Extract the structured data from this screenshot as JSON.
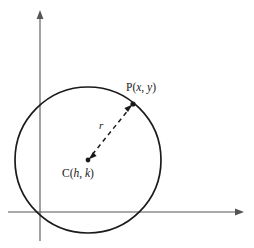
{
  "figure": {
    "name": "circle-with-center-and-point",
    "background_color": "#ffffff",
    "stroke_color": "#1a1a1a",
    "axis_color": "#555555",
    "labels": {
      "point_p": {
        "prefix": "P(",
        "var_x": "x",
        "separator": ", ",
        "var_y": "y",
        "suffix": ")",
        "full_text": "P(x, y)"
      },
      "center_c": {
        "prefix": "C(",
        "var_h": "h",
        "separator": ", ",
        "var_k": "k",
        "suffix": ")",
        "full_text": "C(h, k)"
      },
      "radius_r": {
        "full_text": "r"
      }
    },
    "axes": {
      "x_axis_label": "",
      "y_axis_label": "",
      "origin_x": 40,
      "origin_y": 212,
      "x_axis_start": 8,
      "x_axis_end": 244,
      "y_axis_top": 10,
      "y_axis_bottom": 241
    },
    "circle": {
      "center_x": 88,
      "center_y": 160,
      "radius": 73
    },
    "point_p_marker": {
      "x": 133,
      "y": 104
    },
    "center_marker": {
      "x": 88,
      "y": 160
    },
    "radius_segment": {
      "from_x": 88,
      "from_y": 160,
      "to_x": 133,
      "to_y": 104,
      "style": "dashed",
      "arrow_both_ends": true
    }
  }
}
